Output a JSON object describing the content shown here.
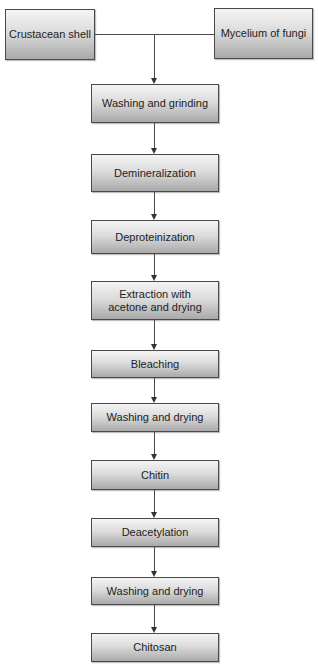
{
  "diagram": {
    "type": "flowchart",
    "title": "",
    "sources": [
      {
        "id": "crustacean-shell",
        "label": "Crustacean shell"
      },
      {
        "id": "mycelium-of-fungi",
        "label": "Mycelium of fungi"
      }
    ],
    "steps": [
      {
        "id": "washing-grinding",
        "label": "Washing and grinding"
      },
      {
        "id": "demineralization",
        "label": "Demineralization"
      },
      {
        "id": "deproteinization",
        "label": "Deproteinization"
      },
      {
        "id": "extraction",
        "label": "Extraction with\nacetone and drying"
      },
      {
        "id": "bleaching",
        "label": "Bleaching"
      },
      {
        "id": "washing-drying-1",
        "label": "Washing and drying"
      },
      {
        "id": "chitin",
        "label": "Chitin"
      },
      {
        "id": "deacetylation",
        "label": "Deacetylation"
      },
      {
        "id": "washing-drying-2",
        "label": "Washing and drying"
      },
      {
        "id": "chitosan",
        "label": "Chitosan"
      }
    ],
    "edges": [
      [
        "crustacean-shell",
        "washing-grinding"
      ],
      [
        "mycelium-of-fungi",
        "washing-grinding"
      ],
      [
        "washing-grinding",
        "demineralization"
      ],
      [
        "demineralization",
        "deproteinization"
      ],
      [
        "deproteinization",
        "extraction"
      ],
      [
        "extraction",
        "bleaching"
      ],
      [
        "bleaching",
        "washing-drying-1"
      ],
      [
        "washing-drying-1",
        "chitin"
      ],
      [
        "chitin",
        "deacetylation"
      ],
      [
        "deacetylation",
        "washing-drying-2"
      ],
      [
        "washing-drying-2",
        "chitosan"
      ]
    ],
    "colors": {
      "border": "#4a4a4a",
      "gradient_top": "#f4f4f4",
      "gradient_bottom": "#a9a9a9",
      "text": "#222222"
    }
  }
}
